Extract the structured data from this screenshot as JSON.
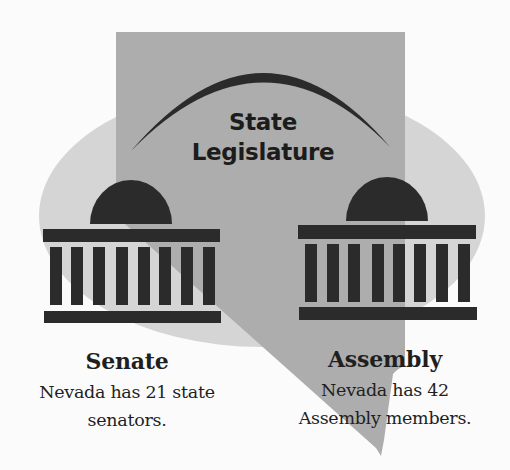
{
  "diagram": {
    "center_label": {
      "line1": "State",
      "line2": "Legislature"
    },
    "senate": {
      "heading": "Senate",
      "line1": "Nevada has 21 state",
      "line2": "senators.",
      "member_count": 21
    },
    "assembly": {
      "heading": "Assembly",
      "line1": "Nevada has 42",
      "line2": "Assembly members.",
      "member_count": 42
    },
    "icons": {
      "state_shape": "nevada-state-silhouette",
      "left_building": "capitol-building-icon",
      "right_building": "capitol-building-icon",
      "arc": "arch-icon"
    },
    "colors": {
      "background": "#fbfbfb",
      "ellipse": "#d5d5d5",
      "state_shape": "#adadad",
      "dark": "#2b2b2b"
    }
  }
}
